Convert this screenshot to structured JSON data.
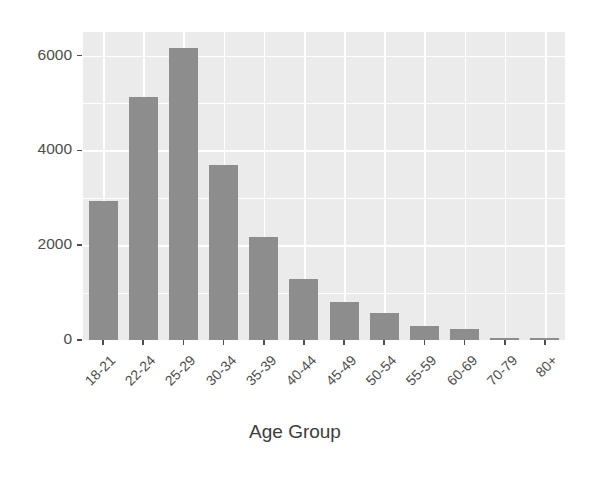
{
  "chart_data": {
    "type": "bar",
    "title": "",
    "subtitle": "",
    "xlabel": "Age Group",
    "ylabel": "",
    "categories": [
      "18-21",
      "22-24",
      "25-29",
      "30-34",
      "35-39",
      "40-44",
      "45-49",
      "50-54",
      "55-59",
      "60-69",
      "70-79",
      "80+"
    ],
    "values": [
      2940,
      5130,
      6170,
      3700,
      2180,
      1290,
      800,
      560,
      290,
      230,
      50,
      40
    ],
    "ylim": [
      0,
      6500
    ],
    "xlim_categories": 12,
    "y_ticks": [
      0,
      2000,
      4000,
      6000
    ],
    "y_tick_labels": [
      "0",
      "2000",
      "4000",
      "6000"
    ],
    "y_minor_ticks": [
      1000,
      3000,
      5000
    ],
    "grid": true,
    "grid_color": "#ffffff",
    "panel_background": "#ebebeb",
    "bar_color": "#8d8d8d",
    "axis_text_color": "#4d4d4d",
    "axis_title_color": "#3c3c3c",
    "legend": null,
    "legend_position": "none",
    "x_tick_label_rotation": -45
  }
}
